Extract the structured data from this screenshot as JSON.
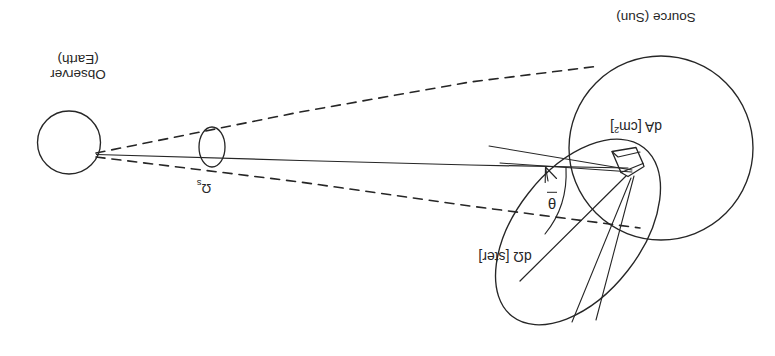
{
  "figure": {
    "orientation": "rotated-180",
    "background_color": "#ffffff",
    "ink_color": "#262626"
  },
  "labels": {
    "observer_line1": "Observer",
    "observer_line2": "(Earth)",
    "source": "Source (Sun)",
    "area_element": "dA [cm",
    "area_element_sup": "2",
    "area_element_close": "]",
    "solid_angle_element": "dΩ [ster]",
    "source_solid_angle": "Ω",
    "source_solid_angle_sub": "s",
    "angle": "θ"
  },
  "elements": {
    "earth_circle": "observer-earth-circle",
    "sun_circle": "source-sun-circle",
    "omega_s_ellipse": "source-solid-angle-ellipse",
    "domega_ellipse": "solid-angle-cone-ellipse",
    "da_patch": "area-element-patch",
    "axis_line": "optical-axis-line",
    "cone_dashed_upper": "cone-edge-dashed-upper",
    "cone_dashed_lower": "cone-edge-dashed-lower",
    "normal_arrow": "surface-normal-arrow",
    "theta_arc": "theta-angle-arc"
  }
}
